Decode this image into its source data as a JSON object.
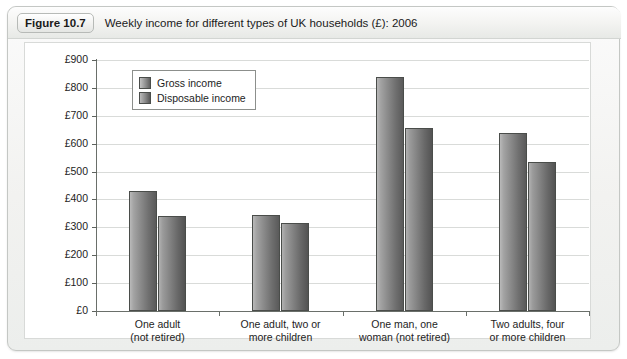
{
  "figure": {
    "tag": "Figure 10.7",
    "caption": "Weekly income for different types of UK households (£): 2006"
  },
  "chart_data": {
    "type": "bar",
    "title": "Weekly income for different types of UK households (£): 2006",
    "xlabel": "",
    "ylabel": "",
    "ylim": [
      0,
      900
    ],
    "ytick_step": 100,
    "ytick_labels": [
      "£0",
      "£100",
      "£200",
      "£300",
      "£400",
      "£500",
      "£600",
      "£700",
      "£800",
      "£900"
    ],
    "grid": true,
    "legend_position": "upper-left-inside",
    "categories": [
      "One adult\n(not retired)",
      "One adult, two or\nmore children",
      "One man, one\nwoman (not retired)",
      "Two adults, four\nor more children"
    ],
    "category_lines": [
      [
        "One adult",
        "(not retired)"
      ],
      [
        "One adult, two or",
        "more children"
      ],
      [
        "One man, one",
        "woman (not retired)"
      ],
      [
        "Two adults, four",
        "or more children"
      ]
    ],
    "series": [
      {
        "name": "Gross income",
        "color": "#8d8d8d",
        "values": [
          430,
          345,
          840,
          640
        ]
      },
      {
        "name": "Disposable income",
        "color": "#868686",
        "values": [
          340,
          315,
          655,
          535
        ]
      }
    ]
  },
  "colors": {
    "card_border": "#c4c7c4",
    "panel_background": "#ffffff",
    "gridline": "#d9dbd9",
    "axis": "#6a6f6a",
    "text": "#1d1d1d"
  }
}
